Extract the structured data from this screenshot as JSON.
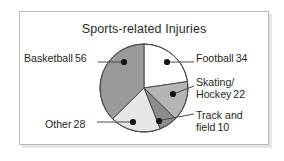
{
  "chart_data": {
    "type": "pie",
    "title": "Sports-related Injuries",
    "xlabel": "",
    "ylabel": "",
    "total": 150,
    "legend_position": "callout-labels",
    "grid": false,
    "start_angle_deg": 0,
    "direction": "clockwise",
    "categories": [
      "Football",
      "Skating/Hockey",
      "Track and field",
      "Other",
      "Basketball"
    ],
    "values": [
      34,
      22,
      10,
      28,
      56
    ],
    "slices": [
      {
        "label": "Football",
        "label_line1": "Football",
        "label_line2": "",
        "value": 34,
        "value_text": "34",
        "percent": 22.7,
        "angle_deg": 81.6,
        "color": "#ffffff"
      },
      {
        "label": "Skating/Hockey",
        "label_line1": "Skating/",
        "label_line2": "Hockey",
        "value": 22,
        "value_text": "22",
        "percent": 14.7,
        "angle_deg": 52.8,
        "color": "#b5b5b5"
      },
      {
        "label": "Track and field",
        "label_line1": "Track and",
        "label_line2": "field",
        "value": 10,
        "value_text": "10",
        "percent": 6.7,
        "angle_deg": 24.0,
        "color": "#8c8c8c"
      },
      {
        "label": "Other",
        "label_line1": "Other",
        "label_line2": "",
        "value": 28,
        "value_text": "28",
        "percent": 18.7,
        "angle_deg": 67.2,
        "color": "#e6e6e6"
      },
      {
        "label": "Basketball",
        "label_line1": "Basketball",
        "label_line2": "",
        "value": 56,
        "value_text": "56",
        "percent": 37.3,
        "angle_deg": 134.4,
        "color": "#9a9a9a"
      }
    ],
    "style": {
      "slice_outline": "#4a4a4a",
      "leader_line": "#4a4a4a",
      "marker_dot": "#151515",
      "frame_border": "#b9b9b9",
      "background": "#ffffff",
      "text": "#1f1f1f"
    }
  }
}
